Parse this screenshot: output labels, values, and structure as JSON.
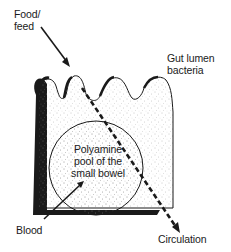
{
  "diagram": {
    "labels": {
      "food_line1": "Food/",
      "food_line2": "feed",
      "bacteria_line1": "Gut lumen",
      "bacteria_line2": "bacteria",
      "pool_line1": "Polyamine",
      "pool_line2": "pool of the",
      "pool_line3": "small bowel",
      "blood": "Blood",
      "circulation": "Circulation"
    },
    "colors": {
      "ink": "#1a1a1a",
      "stipple": "#8a8a8a",
      "background": "#ffffff"
    }
  }
}
